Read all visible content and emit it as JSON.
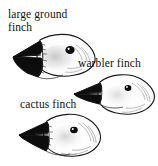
{
  "figure": {
    "background_color": "#ffffff",
    "ink_color": "#111111",
    "width": 158,
    "height": 166
  },
  "specimens": [
    {
      "id": "large-ground-finch",
      "label": "large ground\nfinch",
      "label_lines": [
        "large ground",
        "finch"
      ],
      "beak_type": "massive conical crushing beak",
      "beak_color": "#0d0d0d",
      "eye_color": "#0d0d0d"
    },
    {
      "id": "warbler-finch",
      "label": "warbler finch",
      "label_lines": [
        "warbler finch"
      ],
      "beak_type": "slender pointed probing beak",
      "beak_color": "#0d0d0d",
      "eye_color": "#0d0d0d"
    },
    {
      "id": "cactus-finch",
      "label": "cactus finch",
      "label_lines": [
        "cactus finch"
      ],
      "beak_type": "long tapered probing beak",
      "beak_color": "#0d0d0d",
      "eye_color": "#0d0d0d"
    }
  ]
}
